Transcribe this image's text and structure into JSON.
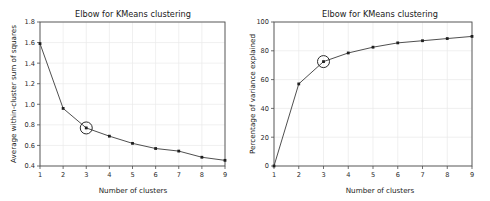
{
  "figure": {
    "background_color": "#ffffff",
    "width": 490,
    "height": 201
  },
  "chart_data": [
    {
      "type": "line",
      "panel": "left",
      "title": "Elbow for KMeans clustering",
      "xlabel": "Number of clusters",
      "ylabel": "Average within-cluster sum of squares",
      "x": [
        1,
        2,
        3,
        4,
        5,
        6,
        7,
        8,
        9
      ],
      "values": [
        1.59,
        0.96,
        0.77,
        0.69,
        0.62,
        0.57,
        0.545,
        0.485,
        0.455
      ],
      "xlim": [
        1,
        9
      ],
      "ylim": [
        0.4,
        1.8
      ],
      "xticks": [
        "1",
        "2",
        "3",
        "4",
        "5",
        "6",
        "7",
        "8",
        "9"
      ],
      "yticks": [
        "0.4",
        "0.6",
        "0.8",
        "1.0",
        "1.2",
        "1.4",
        "1.6",
        "1.8"
      ],
      "ytick_values": [
        0.4,
        0.6,
        0.8,
        1.0,
        1.2,
        1.4,
        1.6,
        1.8
      ],
      "grid": true,
      "legend": "none",
      "annotation": {
        "kind": "circled-elbow-marker",
        "x": 3,
        "y": 0.77,
        "radius_px": 6
      },
      "line_color": "#3b3b3b",
      "marker_color": "#1f1f1f"
    },
    {
      "type": "line",
      "panel": "right",
      "title": "Elbow for KMeans clustering",
      "xlabel": "Number of clusters",
      "ylabel": "Percentage of variance explained",
      "x": [
        1,
        2,
        3,
        4,
        5,
        6,
        7,
        8,
        9
      ],
      "values": [
        0,
        57,
        72.5,
        78.5,
        82.5,
        85.5,
        87,
        88.5,
        90
      ],
      "xlim": [
        1,
        9
      ],
      "ylim": [
        0,
        100
      ],
      "xticks": [
        "1",
        "2",
        "3",
        "4",
        "5",
        "6",
        "7",
        "8",
        "9"
      ],
      "yticks": [
        "0",
        "20",
        "40",
        "60",
        "80",
        "100"
      ],
      "ytick_values": [
        0,
        20,
        40,
        60,
        80,
        100
      ],
      "grid": true,
      "legend": "none",
      "annotation": {
        "kind": "circled-elbow-marker",
        "x": 3,
        "y": 72.5,
        "radius_px": 6
      },
      "line_color": "#3b3b3b",
      "marker_color": "#1f1f1f"
    }
  ]
}
